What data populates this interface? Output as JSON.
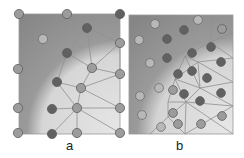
{
  "figure": {
    "panels": [
      {
        "label": "a",
        "frame": {
          "x": 19,
          "y": 14,
          "w": 101,
          "h": 120
        },
        "nodes": [
          {
            "x": 19,
            "y": 14,
            "tone": "mid"
          },
          {
            "x": 67,
            "y": 14,
            "tone": "mid"
          },
          {
            "x": 120,
            "y": 14,
            "tone": "dark"
          },
          {
            "x": 43,
            "y": 39,
            "tone": "light"
          },
          {
            "x": 87,
            "y": 28,
            "tone": "dark"
          },
          {
            "x": 67,
            "y": 53,
            "tone": "dark"
          },
          {
            "x": 120,
            "y": 43,
            "tone": "mid"
          },
          {
            "x": 18,
            "y": 69,
            "tone": "mid"
          },
          {
            "x": 92,
            "y": 68,
            "tone": "mid"
          },
          {
            "x": 120,
            "y": 74,
            "tone": "mid"
          },
          {
            "x": 57,
            "y": 82,
            "tone": "dark"
          },
          {
            "x": 81,
            "y": 88,
            "tone": "mid"
          },
          {
            "x": 18,
            "y": 108,
            "tone": "mid"
          },
          {
            "x": 52,
            "y": 109,
            "tone": "dark"
          },
          {
            "x": 77,
            "y": 108,
            "tone": "mid"
          },
          {
            "x": 120,
            "y": 108,
            "tone": "mid"
          },
          {
            "x": 18,
            "y": 133,
            "tone": "mid"
          },
          {
            "x": 52,
            "y": 134,
            "tone": "dark"
          },
          {
            "x": 77,
            "y": 133,
            "tone": "mid"
          },
          {
            "x": 120,
            "y": 133,
            "tone": "mid"
          }
        ],
        "edges": [
          [
            87,
            28,
            120,
            14
          ],
          [
            87,
            28,
            120,
            43
          ],
          [
            87,
            28,
            67,
            53
          ],
          [
            87,
            28,
            92,
            68
          ],
          [
            67,
            53,
            92,
            68
          ],
          [
            67,
            53,
            57,
            82
          ],
          [
            92,
            68,
            120,
            43
          ],
          [
            92,
            68,
            120,
            74
          ],
          [
            92,
            68,
            81,
            88
          ],
          [
            57,
            82,
            81,
            88
          ],
          [
            81,
            88,
            120,
            74
          ],
          [
            81,
            88,
            120,
            108
          ],
          [
            81,
            88,
            77,
            108
          ],
          [
            57,
            82,
            77,
            108
          ],
          [
            52,
            109,
            77,
            108
          ],
          [
            77,
            108,
            120,
            108
          ],
          [
            77,
            108,
            52,
            134
          ],
          [
            77,
            108,
            77,
            133
          ],
          [
            77,
            108,
            120,
            133
          ],
          [
            120,
            43,
            120,
            74
          ]
        ]
      },
      {
        "label": "b",
        "frame": {
          "x": 129,
          "y": 15,
          "w": 104,
          "h": 119
        },
        "nodes": [
          {
            "x": 155,
            "y": 24,
            "tone": "light"
          },
          {
            "x": 198,
            "y": 20,
            "tone": "light"
          },
          {
            "x": 139,
            "y": 40,
            "tone": "light"
          },
          {
            "x": 184,
            "y": 30,
            "tone": "dark"
          },
          {
            "x": 222,
            "y": 29,
            "tone": "mid"
          },
          {
            "x": 167,
            "y": 39,
            "tone": "dark"
          },
          {
            "x": 192,
            "y": 53,
            "tone": "dark"
          },
          {
            "x": 211,
            "y": 47,
            "tone": "dark"
          },
          {
            "x": 150,
            "y": 63,
            "tone": "light"
          },
          {
            "x": 167,
            "y": 58,
            "tone": "dark"
          },
          {
            "x": 221,
            "y": 62,
            "tone": "dark"
          },
          {
            "x": 178,
            "y": 74,
            "tone": "dark"
          },
          {
            "x": 192,
            "y": 71,
            "tone": "dark"
          },
          {
            "x": 207,
            "y": 78,
            "tone": "dark"
          },
          {
            "x": 159,
            "y": 88,
            "tone": "light"
          },
          {
            "x": 173,
            "y": 90,
            "tone": "mid"
          },
          {
            "x": 184,
            "y": 94,
            "tone": "dark"
          },
          {
            "x": 200,
            "y": 101,
            "tone": "dark"
          },
          {
            "x": 221,
            "y": 93,
            "tone": "dark"
          },
          {
            "x": 140,
            "y": 96,
            "tone": "light"
          },
          {
            "x": 173,
            "y": 113,
            "tone": "mid"
          },
          {
            "x": 142,
            "y": 115,
            "tone": "light"
          },
          {
            "x": 161,
            "y": 127,
            "tone": "light"
          },
          {
            "x": 178,
            "y": 124,
            "tone": "mid"
          },
          {
            "x": 201,
            "y": 124,
            "tone": "mid"
          },
          {
            "x": 222,
            "y": 116,
            "tone": "mid"
          }
        ],
        "edges": [
          [
            213,
            15,
            233,
            33
          ],
          [
            213,
            15,
            210,
            42
          ],
          [
            210,
            42,
            233,
            33
          ],
          [
            210,
            42,
            233,
            58
          ],
          [
            210,
            42,
            185,
            56
          ],
          [
            185,
            56,
            198,
            62
          ],
          [
            198,
            62,
            233,
            58
          ],
          [
            198,
            62,
            233,
            82
          ],
          [
            185,
            56,
            175,
            79
          ],
          [
            175,
            79,
            198,
            62
          ],
          [
            198,
            62,
            200,
            88
          ],
          [
            200,
            88,
            233,
            82
          ],
          [
            175,
            79,
            200,
            88
          ],
          [
            175,
            79,
            186,
            102
          ],
          [
            186,
            102,
            200,
            88
          ],
          [
            200,
            88,
            233,
            106
          ],
          [
            186,
            102,
            233,
            106
          ],
          [
            186,
            102,
            168,
            102
          ],
          [
            168,
            102,
            175,
            79
          ],
          [
            168,
            102,
            168,
            117
          ],
          [
            168,
            117,
            186,
            102
          ],
          [
            186,
            102,
            185,
            134
          ],
          [
            168,
            117,
            185,
            134
          ],
          [
            168,
            117,
            150,
            134
          ],
          [
            186,
            102,
            233,
            134
          ],
          [
            185,
            56,
            200,
            88
          ],
          [
            233,
            106,
            185,
            134
          ]
        ]
      }
    ]
  },
  "colors": {
    "dark_fill": "#8a8a8a",
    "light_fill": "#dcdcdc",
    "node_dark": "#616161",
    "node_mid": "#9c9c9c",
    "node_light": "#b8b8b8",
    "edge": "#8f8f8f",
    "label": "#222222"
  }
}
